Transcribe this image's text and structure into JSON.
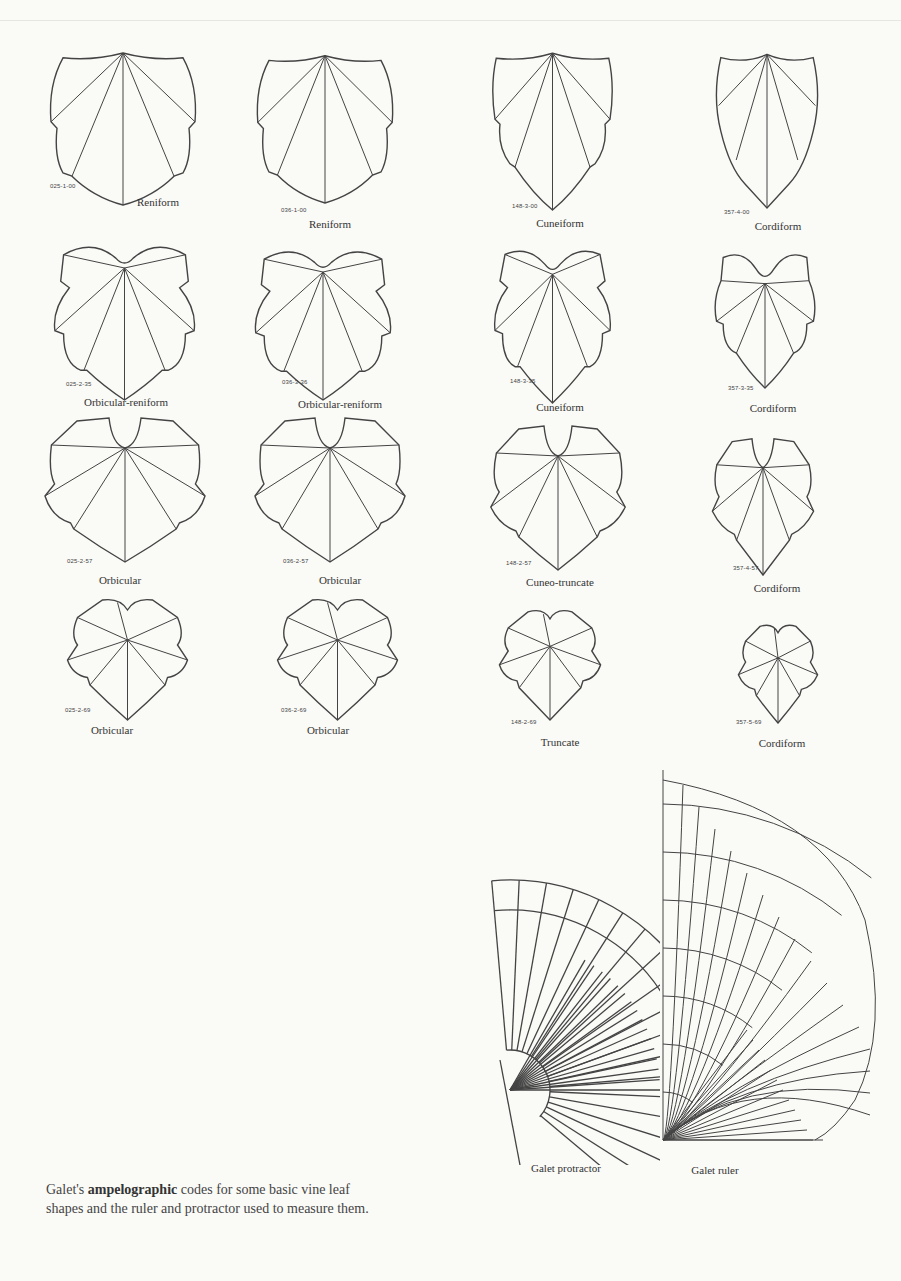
{
  "figure": {
    "leaves": [
      {
        "code": "025-1-00",
        "name": "Reniform",
        "shape": "reniform",
        "x": 48,
        "y": 45,
        "w": 150,
        "h": 160,
        "codeX": 50,
        "codeY": 183,
        "nameX": 158,
        "nameY": 196
      },
      {
        "code": "036-1-00",
        "name": "Reniform",
        "shape": "reniform",
        "x": 255,
        "y": 48,
        "w": 140,
        "h": 155,
        "codeX": 281,
        "codeY": 207,
        "nameX": 330,
        "nameY": 218
      },
      {
        "code": "148-3-00",
        "name": "Cuneiform",
        "shape": "cuneiform",
        "x": 490,
        "y": 45,
        "w": 125,
        "h": 165,
        "codeX": 512,
        "codeY": 203,
        "nameX": 560,
        "nameY": 217
      },
      {
        "code": "357-4-00",
        "name": "Cordiform",
        "shape": "cordiform",
        "x": 712,
        "y": 48,
        "w": 110,
        "h": 160,
        "codeX": 724,
        "codeY": 209,
        "nameX": 778,
        "nameY": 220
      },
      {
        "code": "025-2-35",
        "name": "Orbicular-reniform",
        "shape": "orbrenif",
        "x": 52,
        "y": 235,
        "w": 145,
        "h": 165,
        "codeX": 66,
        "codeY": 381,
        "nameX": 126,
        "nameY": 396
      },
      {
        "code": "036-3-36",
        "name": "Orbicular-reniform",
        "shape": "orbrenif",
        "x": 253,
        "y": 240,
        "w": 140,
        "h": 160,
        "codeX": 282,
        "codeY": 379,
        "nameX": 340,
        "nameY": 398
      },
      {
        "code": "148-3-35",
        "name": "Cuneiform",
        "shape": "cuneif2",
        "x": 490,
        "y": 238,
        "w": 125,
        "h": 165,
        "codeX": 510,
        "codeY": 378,
        "nameX": 560,
        "nameY": 401
      },
      {
        "code": "357-3-35",
        "name": "Cordiform",
        "shape": "cordif2",
        "x": 710,
        "y": 243,
        "w": 110,
        "h": 145,
        "codeX": 728,
        "codeY": 385,
        "nameX": 773,
        "nameY": 402
      },
      {
        "code": "025-2-57",
        "name": "Orbicular",
        "shape": "orbicular",
        "x": 45,
        "y": 412,
        "w": 160,
        "h": 150,
        "codeX": 67,
        "codeY": 558,
        "nameX": 120,
        "nameY": 574
      },
      {
        "code": "036-2-57",
        "name": "Orbicular",
        "shape": "orbicular",
        "x": 255,
        "y": 412,
        "w": 150,
        "h": 150,
        "codeX": 283,
        "codeY": 558,
        "nameX": 340,
        "nameY": 574
      },
      {
        "code": "148-2-57",
        "name": "Cuneo-truncate",
        "shape": "cuneotrunc",
        "x": 488,
        "y": 420,
        "w": 140,
        "h": 150,
        "codeX": 506,
        "codeY": 560,
        "nameX": 560,
        "nameY": 576
      },
      {
        "code": "357-4-57",
        "name": "Cordiform",
        "shape": "cordif3",
        "x": 708,
        "y": 430,
        "w": 110,
        "h": 145,
        "codeX": 733,
        "codeY": 565,
        "nameX": 777,
        "nameY": 582
      },
      {
        "code": "025-2-69",
        "name": "Orbicular",
        "shape": "orb69",
        "x": 65,
        "y": 595,
        "w": 125,
        "h": 125,
        "codeX": 65,
        "codeY": 707,
        "nameX": 112,
        "nameY": 724
      },
      {
        "code": "036-2-69",
        "name": "Orbicular",
        "shape": "orb69",
        "x": 275,
        "y": 595,
        "w": 125,
        "h": 125,
        "codeX": 281,
        "codeY": 707,
        "nameX": 328,
        "nameY": 724
      },
      {
        "code": "148-2-69",
        "name": "Truncate",
        "shape": "trunc69",
        "x": 495,
        "y": 605,
        "w": 110,
        "h": 115,
        "codeX": 511,
        "codeY": 719,
        "nameX": 560,
        "nameY": 736
      },
      {
        "code": "357-5-69",
        "name": "Cordiform",
        "shape": "cord69",
        "x": 733,
        "y": 618,
        "w": 90,
        "h": 105,
        "codeX": 736,
        "codeY": 719,
        "nameX": 782,
        "nameY": 737
      }
    ],
    "tools": [
      {
        "label": "Galet protractor",
        "labelX": 566,
        "labelY": 1164
      },
      {
        "label": "Galet ruler",
        "labelX": 715,
        "labelY": 1166
      }
    ],
    "protractor_numbers": [
      "8",
      "7",
      "6",
      "5",
      "4",
      "3",
      "2",
      "1",
      "0",
      "8",
      "7",
      "6",
      "5",
      "4",
      "3",
      "2",
      "1",
      "0"
    ],
    "ruler_numbers": [
      "5",
      "6",
      "7",
      "8",
      "9",
      "10",
      "11",
      "12",
      "13",
      "14",
      "15",
      "16",
      "17",
      "18",
      "19"
    ],
    "caption": {
      "prefix": "Galet's ",
      "bold": "ampelographic",
      "suffix": " codes for some basic vine leaf shapes and the ruler and protractor used to measure them."
    }
  }
}
